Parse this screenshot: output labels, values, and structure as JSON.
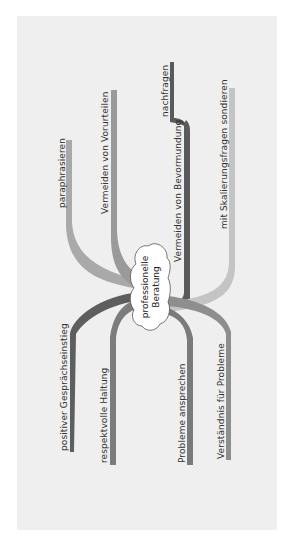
{
  "diagram": {
    "type": "mind-map",
    "orientation": "rotated-90-ccw",
    "center": {
      "label_line1": "professionelle",
      "label_line2": "Beratung"
    },
    "branches": [
      {
        "id": "paraphrasieren",
        "label": "paraphrasieren",
        "color": "#a9a9a9",
        "side": "top"
      },
      {
        "id": "vorurteile",
        "label": "Vermeiden von Vorurteilen",
        "color": "#9a9a9a",
        "side": "top"
      },
      {
        "id": "bevormundung",
        "label": "Vermeiden von Bevormundung",
        "color": "#5a5a5a",
        "side": "top",
        "children": [
          {
            "id": "nachfragen",
            "label": "nachfragen",
            "color": "#5a5a5a"
          }
        ]
      },
      {
        "id": "skalierung",
        "label": "mit Skalierungsfragen sondieren",
        "color": "#c4c4c4",
        "side": "top"
      },
      {
        "id": "einstieg",
        "label": "positiver Gesprächseinstieg",
        "color": "#5e5e5e",
        "side": "bottom"
      },
      {
        "id": "haltung",
        "label": "respektvolle Haltung",
        "color": "#7c7c7c",
        "side": "bottom"
      },
      {
        "id": "probleme",
        "label": "Probleme ansprechen",
        "color": "#7a7a7a",
        "side": "bottom"
      },
      {
        "id": "verstaendnis",
        "label": "Verständnis für Probleme",
        "color": "#8e8e8e",
        "side": "bottom"
      }
    ]
  },
  "colors": {
    "panel": "#efefef",
    "cloud": "#ffffff",
    "text": "#333333"
  }
}
